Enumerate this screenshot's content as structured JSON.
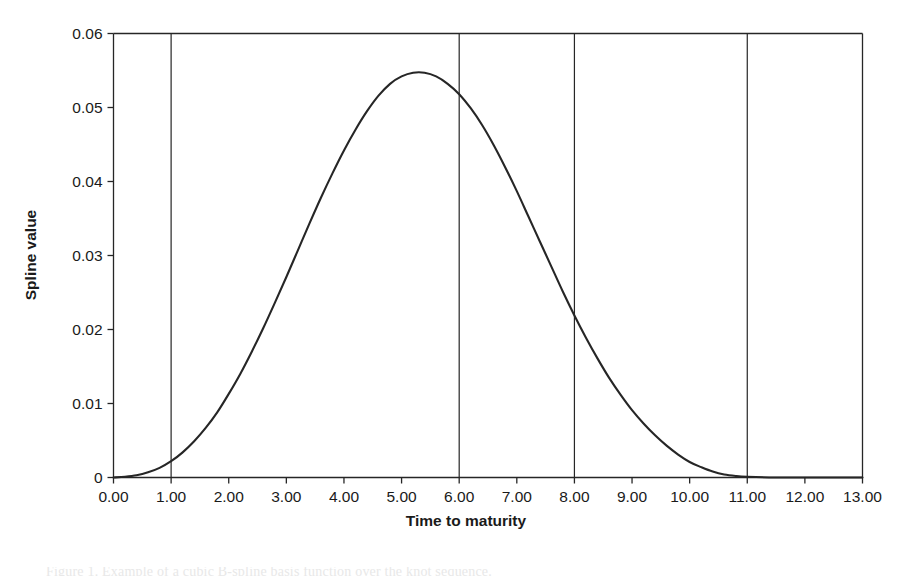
{
  "chart_data": {
    "type": "line",
    "title": "",
    "subtitle": "",
    "xlabel": "Time to maturity",
    "ylabel": "Spline value",
    "xlim": [
      0,
      13
    ],
    "ylim": [
      0,
      0.06
    ],
    "grid": false,
    "legend": null,
    "x_tick_labels": [
      "0.00",
      "1.00",
      "2.00",
      "3.00",
      "4.00",
      "5.00",
      "6.00",
      "7.00",
      "8.00",
      "9.00",
      "10.00",
      "11.00",
      "12.00",
      "13.00"
    ],
    "x_tick_values": [
      0,
      1,
      2,
      3,
      4,
      5,
      6,
      7,
      8,
      9,
      10,
      11,
      12,
      13
    ],
    "y_tick_labels": [
      "0",
      "0.01",
      "0.02",
      "0.03",
      "0.04",
      "0.05",
      "0.06"
    ],
    "y_tick_values": [
      0,
      0.01,
      0.02,
      0.03,
      0.04,
      0.05,
      0.06
    ],
    "knot_lines": [
      1,
      6,
      8,
      11
    ],
    "series": [
      {
        "name": "spline",
        "color": "#262626",
        "x": [
          0.0,
          0.2,
          0.4,
          0.6,
          0.8,
          1.0,
          1.2,
          1.4,
          1.6,
          1.8,
          2.0,
          2.2,
          2.4,
          2.6,
          2.8,
          3.0,
          3.2,
          3.4,
          3.6,
          3.8,
          4.0,
          4.2,
          4.4,
          4.6,
          4.8,
          5.0,
          5.2,
          5.4,
          5.6,
          5.8,
          6.0,
          6.2,
          6.4,
          6.6,
          6.8,
          7.0,
          7.2,
          7.4,
          7.6,
          7.8,
          8.0,
          8.2,
          8.4,
          8.6,
          8.8,
          9.0,
          9.2,
          9.4,
          9.6,
          9.8,
          10.0,
          10.2,
          10.4,
          10.6,
          10.8,
          11.0,
          11.5,
          12.0,
          12.5,
          13.0
        ],
        "y": [
          0.0,
          0.0001,
          0.0003,
          0.0007,
          0.0013,
          0.0022,
          0.0034,
          0.0049,
          0.0067,
          0.0088,
          0.0113,
          0.014,
          0.017,
          0.0202,
          0.0236,
          0.0271,
          0.0307,
          0.0343,
          0.0378,
          0.0411,
          0.0442,
          0.047,
          0.0495,
          0.0516,
          0.0532,
          0.0542,
          0.0547,
          0.0547,
          0.0542,
          0.0532,
          0.0518,
          0.0499,
          0.0476,
          0.0449,
          0.0419,
          0.0387,
          0.0353,
          0.0319,
          0.0285,
          0.0251,
          0.0219,
          0.0189,
          0.0161,
          0.0135,
          0.0112,
          0.0091,
          0.0073,
          0.0057,
          0.0043,
          0.0031,
          0.0021,
          0.0014,
          0.0008,
          0.0004,
          0.0002,
          0.0001,
          0.0,
          0.0,
          0.0,
          0.0
        ]
      }
    ],
    "annotations": [],
    "peak": {
      "x": 5.3,
      "y": 0.0547
    }
  },
  "figure": {
    "caption_fragment": "Figure 1. Example of a cubic B-spline basis function over the knot sequence."
  }
}
